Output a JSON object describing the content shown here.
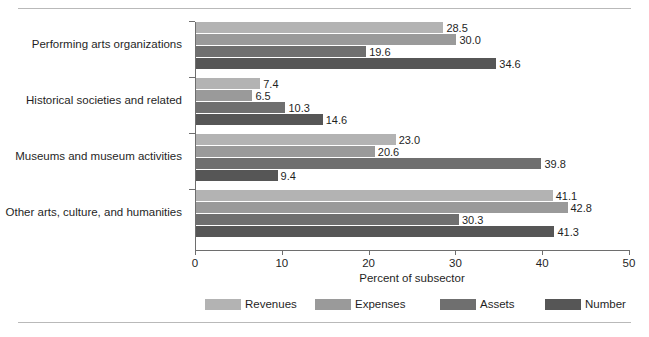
{
  "chart_data": {
    "type": "bar",
    "orientation": "horizontal",
    "title": "",
    "xlabel": "Percent of subsector",
    "ylabel": "",
    "xlim": [
      0,
      50
    ],
    "xticks": [
      0,
      10,
      20,
      30,
      40,
      50
    ],
    "xticklabels": [
      "0",
      "10",
      "20",
      "30",
      "40",
      "50"
    ],
    "grid": false,
    "legend_position": "bottom",
    "categories": [
      "Performing arts organizations",
      "Historical societies and related",
      "Museums and museum activities",
      "Other arts, culture, and humanities"
    ],
    "series": [
      {
        "name": "Revenues",
        "color": "#b3b3b3",
        "values": [
          28.5,
          7.4,
          23.0,
          41.1
        ]
      },
      {
        "name": "Expenses",
        "color": "#9a9a9a",
        "values": [
          30.0,
          6.5,
          20.6,
          42.8
        ]
      },
      {
        "name": "Assets",
        "color": "#6f6f6f",
        "values": [
          19.6,
          10.3,
          39.8,
          30.3
        ]
      },
      {
        "name": "Number",
        "color": "#565656",
        "values": [
          34.6,
          14.6,
          9.4,
          41.3
        ]
      }
    ],
    "value_labels": [
      [
        "28.5",
        "30.0",
        "19.6",
        "34.6"
      ],
      [
        "7.4",
        "6.5",
        "10.3",
        "14.6"
      ],
      [
        "23.0",
        "20.6",
        "39.8",
        "9.4"
      ],
      [
        "41.1",
        "42.8",
        "30.3",
        "41.3"
      ]
    ]
  },
  "legend": {
    "items": [
      {
        "label": "Revenues",
        "color": "#b3b3b3"
      },
      {
        "label": "Expenses",
        "color": "#9a9a9a"
      },
      {
        "label": "Assets",
        "color": "#6f6f6f"
      },
      {
        "label": "Number",
        "color": "#565656"
      }
    ]
  },
  "axis": {
    "x_title": "Percent of subsector"
  },
  "colors": {
    "axis": "#6e6e6e",
    "rule": "#b9b9b9",
    "text": "#1f1f1f",
    "background": "#ffffff"
  }
}
